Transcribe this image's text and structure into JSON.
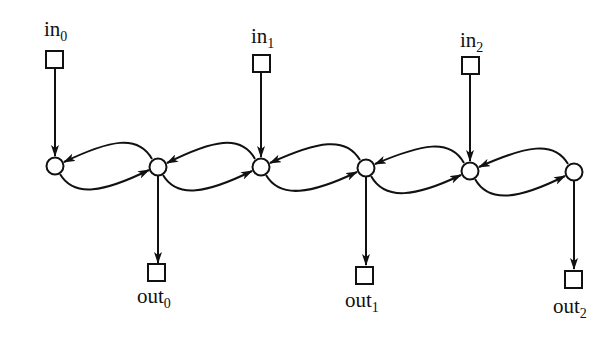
{
  "diagram": {
    "stroke_color": "#111111",
    "background": "#ffffff",
    "nodes": [
      {
        "id": "n0",
        "x": 55,
        "y": 166
      },
      {
        "id": "n1",
        "x": 158,
        "y": 167
      },
      {
        "id": "n2",
        "x": 261,
        "y": 167
      },
      {
        "id": "n3",
        "x": 366,
        "y": 168
      },
      {
        "id": "n4",
        "x": 470,
        "y": 171
      },
      {
        "id": "n5",
        "x": 574,
        "y": 172
      }
    ],
    "inputs": [
      {
        "label": "in",
        "sub": "0",
        "node": "n0"
      },
      {
        "label": "in",
        "sub": "1",
        "node": "n2"
      },
      {
        "label": "in",
        "sub": "2",
        "node": "n4"
      }
    ],
    "outputs": [
      {
        "label": "out",
        "sub": "0",
        "node": "n1"
      },
      {
        "label": "out",
        "sub": "1",
        "node": "n3"
      },
      {
        "label": "out",
        "sub": "2",
        "node": "n5"
      }
    ],
    "edges_forward": [
      "n0->n1",
      "n1->n2",
      "n2->n3",
      "n3->n4",
      "n4->n5"
    ],
    "edges_backward": [
      "n1->n0",
      "n2->n1",
      "n3->n2",
      "n4->n3",
      "n5->n4"
    ]
  }
}
